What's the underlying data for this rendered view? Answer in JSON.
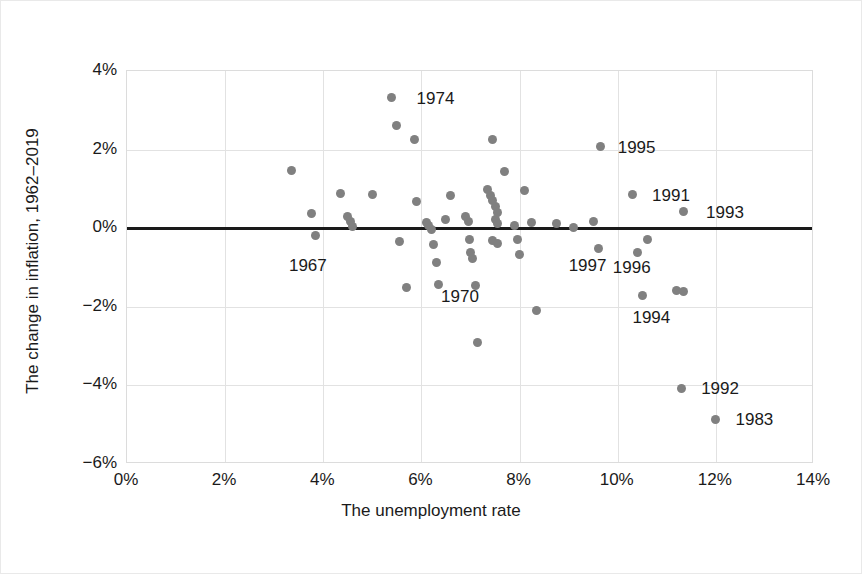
{
  "chart_data": {
    "type": "scatter",
    "title": "",
    "xlabel": "The unemployment rate",
    "ylabel": "The change in inflation, 1962–2019",
    "xlim": [
      0,
      14
    ],
    "ylim": [
      -6,
      4
    ],
    "xticks": [
      "0%",
      "2%",
      "4%",
      "6%",
      "8%",
      "10%",
      "12%",
      "14%"
    ],
    "xtick_values": [
      0,
      2,
      4,
      6,
      8,
      10,
      12,
      14
    ],
    "yticks": [
      "4%",
      "2%",
      "0%",
      "−2%",
      "−4%",
      "−6%"
    ],
    "ytick_values": [
      4,
      2,
      0,
      -2,
      -4,
      -6
    ],
    "grid": true,
    "legend": false,
    "reference_line": {
      "y": 0,
      "color": "#1a1a1a",
      "width": 3
    },
    "point_color": "#808080",
    "point_size": 9,
    "points": [
      {
        "x": 3.35,
        "y": 1.48
      },
      {
        "x": 3.75,
        "y": 0.38
      },
      {
        "x": 3.85,
        "y": -0.18
      },
      {
        "x": 4.35,
        "y": 0.88
      },
      {
        "x": 4.5,
        "y": 0.3
      },
      {
        "x": 4.55,
        "y": 0.18
      },
      {
        "x": 4.6,
        "y": 0.05
      },
      {
        "x": 5.0,
        "y": 0.86
      },
      {
        "x": 5.4,
        "y": 3.32
      },
      {
        "x": 5.5,
        "y": 2.62
      },
      {
        "x": 5.55,
        "y": -0.33
      },
      {
        "x": 5.7,
        "y": -1.52
      },
      {
        "x": 5.85,
        "y": 2.25
      },
      {
        "x": 5.9,
        "y": 0.68
      },
      {
        "x": 6.1,
        "y": 0.14
      },
      {
        "x": 6.15,
        "y": 0.07
      },
      {
        "x": 6.2,
        "y": -0.04
      },
      {
        "x": 6.25,
        "y": -0.42
      },
      {
        "x": 6.3,
        "y": -0.88
      },
      {
        "x": 6.35,
        "y": -1.42
      },
      {
        "x": 6.5,
        "y": 0.22
      },
      {
        "x": 6.6,
        "y": 0.82
      },
      {
        "x": 6.9,
        "y": 0.3
      },
      {
        "x": 6.95,
        "y": 0.18
      },
      {
        "x": 6.98,
        "y": -0.28
      },
      {
        "x": 7.0,
        "y": -0.62
      },
      {
        "x": 7.05,
        "y": -0.78
      },
      {
        "x": 7.1,
        "y": -1.45
      },
      {
        "x": 7.15,
        "y": -2.9
      },
      {
        "x": 7.45,
        "y": 2.25
      },
      {
        "x": 7.35,
        "y": 0.98
      },
      {
        "x": 7.4,
        "y": 0.82
      },
      {
        "x": 7.45,
        "y": 0.7
      },
      {
        "x": 7.5,
        "y": 0.55
      },
      {
        "x": 7.55,
        "y": 0.4
      },
      {
        "x": 7.5,
        "y": 0.22
      },
      {
        "x": 7.55,
        "y": 0.12
      },
      {
        "x": 7.45,
        "y": -0.32
      },
      {
        "x": 7.55,
        "y": -0.38
      },
      {
        "x": 7.7,
        "y": 1.45
      },
      {
        "x": 7.9,
        "y": 0.08
      },
      {
        "x": 7.95,
        "y": -0.3
      },
      {
        "x": 8.0,
        "y": -0.68
      },
      {
        "x": 8.1,
        "y": 0.95
      },
      {
        "x": 8.25,
        "y": 0.14
      },
      {
        "x": 8.35,
        "y": -2.1
      },
      {
        "x": 8.75,
        "y": 0.12
      },
      {
        "x": 9.1,
        "y": 0.02
      },
      {
        "x": 9.5,
        "y": 0.18
      },
      {
        "x": 9.6,
        "y": -0.52
      },
      {
        "x": 9.65,
        "y": 2.08
      },
      {
        "x": 10.3,
        "y": 0.85
      },
      {
        "x": 10.4,
        "y": -0.62
      },
      {
        "x": 10.5,
        "y": -1.72
      },
      {
        "x": 10.6,
        "y": -0.28
      },
      {
        "x": 11.2,
        "y": -1.58
      },
      {
        "x": 11.35,
        "y": -1.62
      },
      {
        "x": 11.35,
        "y": 0.42
      },
      {
        "x": 11.3,
        "y": -4.08
      },
      {
        "x": 12.0,
        "y": -4.88
      }
    ],
    "annotations": [
      {
        "label": "1974",
        "x": 5.9,
        "y": 3.3
      },
      {
        "label": "1995",
        "x": 10.0,
        "y": 2.05
      },
      {
        "label": "1991",
        "x": 10.7,
        "y": 0.82
      },
      {
        "label": "1993",
        "x": 11.8,
        "y": 0.38
      },
      {
        "label": "1967",
        "x": 3.3,
        "y": -0.95
      },
      {
        "label": "1970",
        "x": 6.4,
        "y": -1.75
      },
      {
        "label": "1997",
        "x": 9.0,
        "y": -0.95
      },
      {
        "label": "1996",
        "x": 9.9,
        "y": -1.02
      },
      {
        "label": "1994",
        "x": 10.3,
        "y": -2.28
      },
      {
        "label": "1992",
        "x": 11.7,
        "y": -4.08
      },
      {
        "label": "1983",
        "x": 12.4,
        "y": -4.88
      }
    ]
  }
}
